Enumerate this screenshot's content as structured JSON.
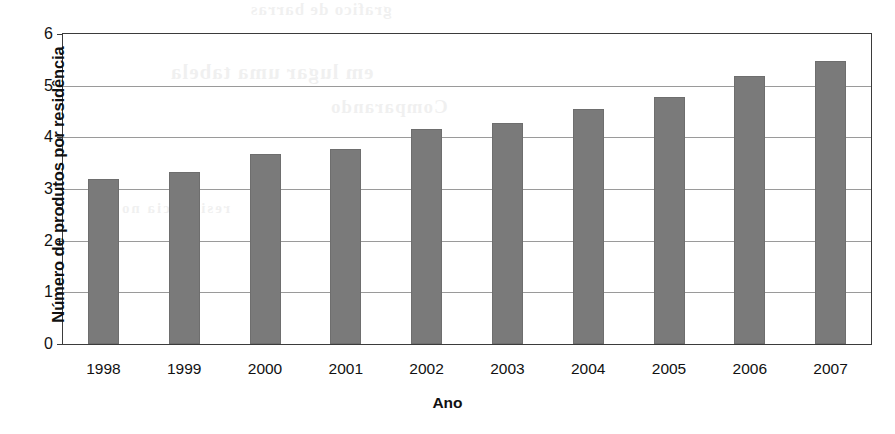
{
  "chart_data": {
    "type": "bar",
    "title": "",
    "subtitle": "",
    "xlabel": "Ano",
    "ylabel": "Número de produtos por residência",
    "categories": [
      "1998",
      "1999",
      "2000",
      "2001",
      "2002",
      "2003",
      "2004",
      "2005",
      "2006",
      "2007"
    ],
    "values": [
      3.2,
      3.33,
      3.67,
      3.77,
      4.17,
      4.27,
      4.55,
      4.79,
      5.19,
      5.47
    ],
    "series": [
      {
        "name": "Número de produtos por residência",
        "values": [
          3.2,
          3.33,
          3.67,
          3.77,
          4.17,
          4.27,
          4.55,
          4.79,
          5.19,
          5.47
        ]
      }
    ],
    "ylim": [
      0,
      6
    ],
    "yticks": [
      "0",
      "1",
      "2",
      "3",
      "4",
      "5",
      "6"
    ],
    "ytick_values": [
      0,
      1,
      2,
      3,
      4,
      5,
      6
    ],
    "xtick_labels": [
      "1998",
      "1999",
      "2000",
      "2001",
      "2002",
      "2003",
      "2004",
      "2005",
      "2006",
      "2007"
    ],
    "grid": "horizontal",
    "legend": "none",
    "bar_color": "#7a7a7a",
    "gridline_color": "#9a9a9a",
    "axis_color": "#3b3b3b",
    "background_color": "#ffffff",
    "annotations": []
  },
  "ghost_text": {
    "line_a": "em lugar uma tabela",
    "line_b": "Comparando",
    "line_c": "grafico de barras",
    "line_d": "residencia no"
  }
}
